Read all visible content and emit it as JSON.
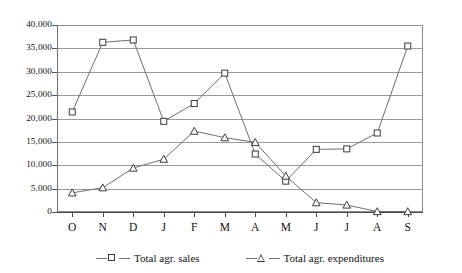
{
  "chart_data": {
    "type": "line",
    "title": "",
    "xlabel": "",
    "ylabel": "",
    "ylim": [
      0,
      40000
    ],
    "yticks": [
      0,
      5000,
      10000,
      15000,
      20000,
      25000,
      30000,
      35000,
      40000
    ],
    "ytick_labels": [
      "0",
      "5,000",
      "10,000",
      "15,000",
      "20,000",
      "25,000",
      "30,000",
      "35,000",
      "40,000"
    ],
    "grid": true,
    "legend_position": "bottom",
    "categories": [
      "O",
      "N",
      "D",
      "J",
      "F",
      "M",
      "A",
      "M",
      "J",
      "J",
      "A",
      "S"
    ],
    "series": [
      {
        "name": "Total agr. sales",
        "marker": "square",
        "values": [
          21400,
          36300,
          36800,
          19400,
          23200,
          29700,
          12400,
          6600,
          13400,
          13500,
          16900,
          35500
        ]
      },
      {
        "name": "Total agr. expenditures",
        "marker": "triangle",
        "values": [
          4100,
          5200,
          9400,
          11300,
          17300,
          15900,
          14900,
          7700,
          2000,
          1500,
          100,
          100
        ]
      }
    ]
  },
  "legend": {
    "items": [
      {
        "label": "Total agr. sales",
        "marker": "square-marker-icon"
      },
      {
        "label": "Total agr. expenditures",
        "marker": "triangle-marker-icon"
      }
    ]
  },
  "colors": {
    "line": "#6f6f6f",
    "marker_stroke": "#3a3a3a",
    "grid": "#9a9a9a",
    "axis": "#4a4a4a",
    "background": "#ffffff"
  }
}
